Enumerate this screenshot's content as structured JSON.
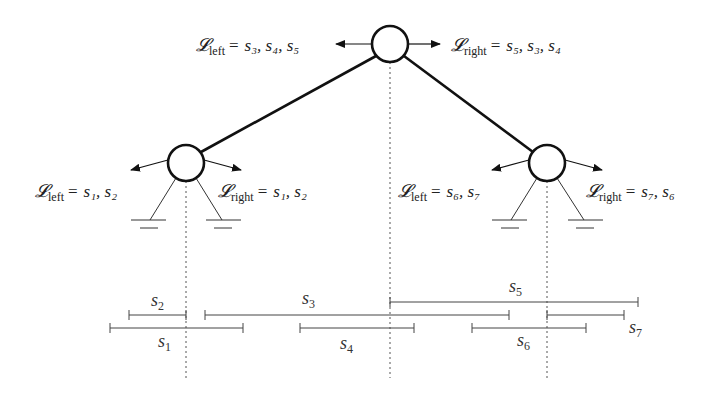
{
  "diagram": {
    "type": "binary-tree-with-intervals",
    "nodes": [
      {
        "id": "root",
        "cx": 390,
        "cy": 44,
        "r": 18,
        "left_label": {
          "symbol": "L",
          "sub": "left",
          "values": "s3, s4, s5"
        },
        "right_label": {
          "symbol": "L",
          "sub": "right",
          "values": "s5, s3, s4"
        }
      },
      {
        "id": "left-child",
        "cx": 186,
        "cy": 163,
        "r": 18,
        "left_label": {
          "symbol": "L",
          "sub": "left",
          "values": "s1, s2"
        },
        "right_label": {
          "symbol": "L",
          "sub": "right",
          "values": "s1, s2"
        }
      },
      {
        "id": "right-child",
        "cx": 547,
        "cy": 163,
        "r": 18,
        "left_label": {
          "symbol": "L",
          "sub": "left",
          "values": "s6, s7"
        },
        "right_label": {
          "symbol": "L",
          "sub": "right",
          "values": "s7, s6"
        }
      }
    ],
    "edges": [
      [
        "root",
        "left-child"
      ],
      [
        "root",
        "right-child"
      ]
    ],
    "segments": [
      {
        "name": "s1",
        "base": "s",
        "sub": "1",
        "x1": 110,
        "x2": 243,
        "y": 328
      },
      {
        "name": "s2",
        "base": "s",
        "sub": "2",
        "x1": 129,
        "x2": 186,
        "y": 315
      },
      {
        "name": "s3",
        "base": "s",
        "sub": "3",
        "x1": 205,
        "x2": 509,
        "y": 315
      },
      {
        "name": "s4",
        "base": "s",
        "sub": "4",
        "x1": 300,
        "x2": 414,
        "y": 328
      },
      {
        "name": "s5",
        "base": "s",
        "sub": "5",
        "x1": 390,
        "x2": 638,
        "y": 302
      },
      {
        "name": "s6",
        "base": "s",
        "sub": "6",
        "x1": 472,
        "x2": 586,
        "y": 328
      },
      {
        "name": "s7",
        "base": "s",
        "sub": "7",
        "x1": 547,
        "x2": 624,
        "y": 315
      }
    ]
  },
  "labels": {
    "root_left": {
      "sym": "𝓛",
      "sub": "left",
      "eq": "=",
      "vals": "s₃, s₄, s₅"
    },
    "root_right": {
      "sym": "𝓛",
      "sub": "right",
      "eq": "=",
      "vals": "s₅, s₃, s₄"
    },
    "lc_left": {
      "sym": "𝓛",
      "sub": "left",
      "eq": "=",
      "vals": "s₁, s₂"
    },
    "lc_right": {
      "sym": "𝓛",
      "sub": "right",
      "eq": "=",
      "vals": "s₁, s₂"
    },
    "rc_left": {
      "sym": "𝓛",
      "sub": "left",
      "eq": "=",
      "vals": "s₆, s₇"
    },
    "rc_right": {
      "sym": "𝓛",
      "sub": "right",
      "eq": "=",
      "vals": "s₇, s₆"
    }
  },
  "segment_labels": {
    "s1": {
      "base": "s",
      "sub": "1"
    },
    "s2": {
      "base": "s",
      "sub": "2"
    },
    "s3": {
      "base": "s",
      "sub": "3"
    },
    "s4": {
      "base": "s",
      "sub": "4"
    },
    "s5": {
      "base": "s",
      "sub": "5"
    },
    "s6": {
      "base": "s",
      "sub": "6"
    },
    "s7": {
      "base": "s",
      "sub": "7"
    }
  }
}
